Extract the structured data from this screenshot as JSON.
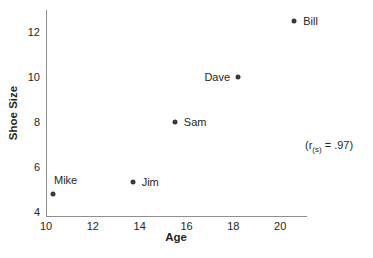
{
  "chart_data": {
    "type": "scatter",
    "title": "",
    "xlabel": "Age",
    "ylabel": "Shoe Size",
    "xlim": [
      10,
      21.1
    ],
    "ylim": [
      3.8,
      13.0
    ],
    "x_ticks": [
      10,
      12,
      14,
      16,
      18,
      20
    ],
    "y_ticks": [
      4,
      6,
      8,
      10,
      12
    ],
    "grid": false,
    "legend": "none",
    "points": [
      {
        "label": "Mike",
        "age": 10.3,
        "shoe_size": 4.8,
        "label_position": "above"
      },
      {
        "label": "Jim",
        "age": 13.7,
        "shoe_size": 5.3,
        "label_position": "right"
      },
      {
        "label": "Sam",
        "age": 15.5,
        "shoe_size": 8.0,
        "label_position": "right"
      },
      {
        "label": "Dave",
        "age": 18.2,
        "shoe_size": 10.0,
        "label_position": "left"
      },
      {
        "label": "Bill",
        "age": 20.6,
        "shoe_size": 12.5,
        "label_position": "right"
      }
    ],
    "annotation": {
      "prefix": "(r",
      "subscript": "(s)",
      "suffix": " = .97)"
    },
    "point_color": "#3a3a3a",
    "axis_color": "#8f8f8f",
    "text_color": "#262626"
  }
}
